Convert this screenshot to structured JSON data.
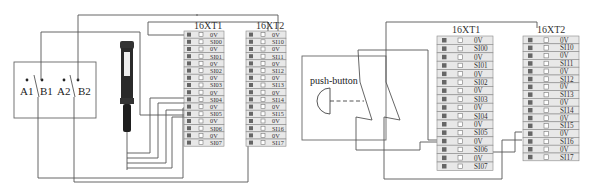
{
  "left_diagram": {
    "switch_labels": [
      "A1",
      "B1",
      "A2",
      "B2"
    ],
    "device": "proximity-sensor",
    "terminal_blocks": [
      {
        "title": "16XT1",
        "rows": [
          "0V",
          "SI00",
          "0V",
          "SI01",
          "0V",
          "SI02",
          "0V",
          "SI03",
          "0V",
          "SI04",
          "0V",
          "SI05",
          "0V",
          "SI06",
          "0V",
          "SI07"
        ]
      },
      {
        "title": "16XT2",
        "rows": [
          "0V",
          "SI10",
          "0V",
          "SI11",
          "0V",
          "SI12",
          "0V",
          "SI13",
          "0V",
          "SI14",
          "0V",
          "SI15",
          "0V",
          "SI16",
          "0V",
          "SI17"
        ]
      }
    ]
  },
  "right_diagram": {
    "push_button_label": "push-button",
    "terminal_blocks": [
      {
        "title": "16XT1",
        "rows": [
          "0V",
          "SI00",
          "0V",
          "SI01",
          "0V",
          "SI02",
          "0V",
          "SI03",
          "0V",
          "SI04",
          "0V",
          "SI05",
          "0V",
          "SI06",
          "0V",
          "SI07"
        ]
      },
      {
        "title": "16XT2",
        "rows": [
          "0V",
          "SI10",
          "0V",
          "SI11",
          "0V",
          "SI12",
          "0V",
          "SI13",
          "0V",
          "SI14",
          "0V",
          "SI15",
          "0V",
          "SI16",
          "0V",
          "SI17"
        ]
      }
    ]
  }
}
